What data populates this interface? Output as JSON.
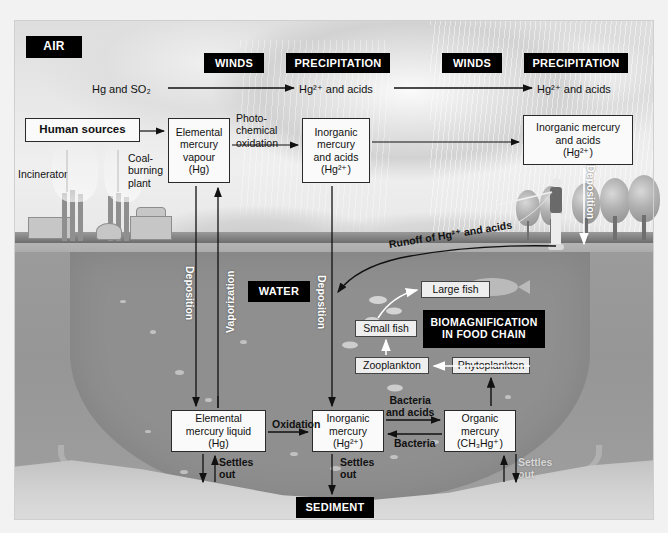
{
  "diagram": {
    "title_cut_off": "",
    "zones": [
      {
        "id": "air",
        "label": "AIR"
      },
      {
        "id": "water",
        "label": "WATER"
      },
      {
        "id": "sediment",
        "label": "SEDIMENT"
      }
    ],
    "atmosphere_tags": [
      {
        "id": "winds-1",
        "label": "WINDS"
      },
      {
        "id": "precipitation-1",
        "label": "PRECIPITATION"
      },
      {
        "id": "winds-2",
        "label": "WINDS"
      },
      {
        "id": "precipitation-2",
        "label": "PRECIPITATION"
      }
    ],
    "biomagnification_tag": "BIOMAGNIFICATION\nIN FOOD CHAIN",
    "air_flow_labels": [
      {
        "id": "emission-label",
        "label": "Hg and SO2"
      },
      {
        "id": "deposit-label-1",
        "label": "Hg2+ and acids"
      },
      {
        "id": "deposit-label-2",
        "label": "Hg2+ and acids"
      }
    ],
    "boxes": [
      {
        "id": "human-sources",
        "label": "Human sources"
      },
      {
        "id": "elemental-vapour",
        "label": "Elemental\nmercury\nvapour\n(Hg)"
      },
      {
        "id": "inorganic-air",
        "label": "Inorganic\nmercury\nand acids\n(Hg2+)"
      },
      {
        "id": "inorganic-air-right",
        "label": "Inorganic mercury\nand acids\n(Hg2+)"
      },
      {
        "id": "elemental-liquid",
        "label": "Elemental\nmercury liquid\n(Hg)"
      },
      {
        "id": "inorganic-water",
        "label": "Inorganic\nmercury\n(Hg2+)"
      },
      {
        "id": "organic-mercury",
        "label": "Organic\nmercury\n(CH3Hg+)"
      },
      {
        "id": "large-fish",
        "label": "Large fish"
      },
      {
        "id": "small-fish",
        "label": "Small fish"
      },
      {
        "id": "zooplankton",
        "label": "Zooplankton"
      },
      {
        "id": "phytoplankton",
        "label": "Phytoplankton"
      }
    ],
    "scene_labels": [
      {
        "id": "incinerator",
        "label": "Incinerator"
      },
      {
        "id": "coal-plant",
        "label": "Coal-\nburning\nplant"
      }
    ],
    "process_labels": [
      {
        "id": "photochemical-oxidation",
        "label": "Photo-\nchemical\noxidation"
      },
      {
        "id": "runoff",
        "label": "Runoff of Hg2+ and acids"
      },
      {
        "id": "oxidation",
        "label": "Oxidation"
      },
      {
        "id": "bacteria-and-acids",
        "label": "Bacteria\nand acids"
      },
      {
        "id": "bacteria",
        "label": "Bacteria"
      },
      {
        "id": "settles-out-left",
        "label": "Settles\nout"
      },
      {
        "id": "settles-out-mid",
        "label": "Settles\nout"
      },
      {
        "id": "settles-out-right",
        "label": "Settles\nout"
      }
    ],
    "vertical_labels": [
      {
        "id": "deposition-left",
        "label": "Deposition"
      },
      {
        "id": "vaporization",
        "label": "Vaporization"
      },
      {
        "id": "deposition-mid",
        "label": "Deposition"
      },
      {
        "id": "deposition-right",
        "label": "Deposition"
      }
    ],
    "colors": {
      "tag_background": "#000000",
      "tag_text": "#ffffff",
      "box_background": "#fafafa",
      "box_border": "#2a2a2a",
      "water": "#969696",
      "sky": "#e4e4e4",
      "sediment_band": "#c0c0c0"
    }
  }
}
